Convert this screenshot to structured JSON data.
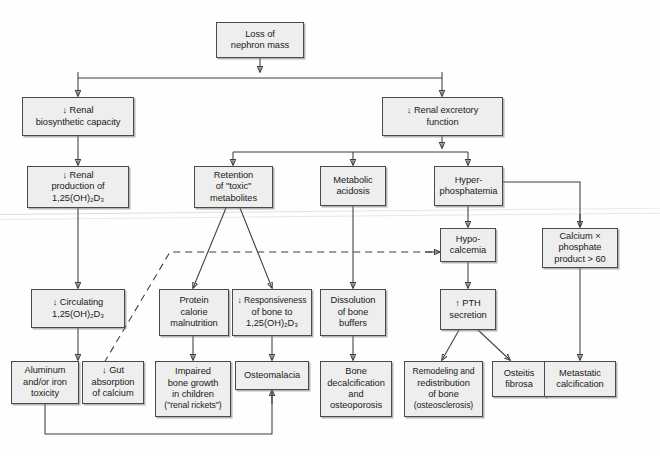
{
  "diagram": {
    "type": "flowchart",
    "box_fill": "#eeeeee",
    "box_stroke": "#4a4a4a",
    "nodes": [
      {
        "id": "loss",
        "label": "Loss of\nnephron mass",
        "line1": "Loss of",
        "line2": "nephron mass",
        "line3": "",
        "line4": ""
      },
      {
        "id": "biosynth",
        "label": "↓ Renal\nbiosynthetic capacity",
        "line1": "↓ Renal",
        "line2": "biosynthetic capacity",
        "line3": "",
        "line4": ""
      },
      {
        "id": "excretory",
        "label": "↓ Renal excretory\nfunction",
        "line1": "↓ Renal excretory",
        "line2": "function",
        "line3": "",
        "line4": ""
      },
      {
        "id": "production",
        "label": "↓ Renal\nproduction of\n1,25(OH)2D3",
        "line1": "↓ Renal",
        "line2": "production of",
        "line3": "1,25(OH)₂D₃",
        "line4": ""
      },
      {
        "id": "retention",
        "label": "Retention\nof \"toxic\"\nmetabolites",
        "line1": "Retention",
        "line2": "of \"toxic\"",
        "line3": "metabolites",
        "line4": ""
      },
      {
        "id": "acidosis",
        "label": "Metabolic\nacidosis",
        "line1": "Metabolic",
        "line2": "acidosis",
        "line3": "",
        "line4": ""
      },
      {
        "id": "hyperphos",
        "label": "Hyper-\nphosphatemia",
        "line1": "Hyper-",
        "line2": "phosphatemia",
        "line3": "",
        "line4": ""
      },
      {
        "id": "hypocalcemia",
        "label": "Hypo-\ncalcemia",
        "line1": "Hypo-",
        "line2": "calcemia",
        "line3": "",
        "line4": ""
      },
      {
        "id": "caxphos",
        "label": "Calcium ×\nphosphate\nproduct > 60",
        "line1": "Calcium ×",
        "line2": "phosphate",
        "line3": "product > 60",
        "line4": ""
      },
      {
        "id": "circulating",
        "label": "↓ Circulating\n1,25(OH)2D3",
        "line1": "↓ Circulating",
        "line2": "1,25(OH)₂D₃",
        "line3": "",
        "line4": ""
      },
      {
        "id": "pcm",
        "label": "Protein\ncalorie\nmalnutrition",
        "line1": "Protein",
        "line2": "calorie",
        "line3": "malnutrition",
        "line4": ""
      },
      {
        "id": "responsiveness",
        "label": "↓ Responsiveness\nof bone to\n1,25(OH)2D3",
        "line1": "↓ Responsiveness",
        "line2": "of bone to",
        "line3": "1,25(OH)₂D₃",
        "line4": ""
      },
      {
        "id": "dissolution",
        "label": "Dissolution\nof bone\nbuffers",
        "line1": "Dissolution",
        "line2": "of bone",
        "line3": "buffers",
        "line4": ""
      },
      {
        "id": "pth",
        "label": "↑ PTH\nsecretion",
        "line1": "↑ PTH",
        "line2": "secretion",
        "line3": "",
        "line4": ""
      },
      {
        "id": "aluminum",
        "label": "Aluminum\nand/or iron\ntoxicity",
        "line1": "Aluminum",
        "line2": "and/or iron",
        "line3": "toxicity",
        "line4": ""
      },
      {
        "id": "gut",
        "label": "↓ Gut\nabsorption\nof calcium",
        "line1": "↓ Gut",
        "line2": "absorption",
        "line3": "of calcium",
        "line4": ""
      },
      {
        "id": "impaired",
        "label": "Impaired\nbone growth\nin children\n(\"renal rickets\")",
        "line1": "Impaired",
        "line2": "bone growth",
        "line3": "in children",
        "line4": "(\"renal rickets\")"
      },
      {
        "id": "osteomalacia",
        "label": "Osteomalacia",
        "line1": "Osteomalacia",
        "line2": "",
        "line3": "",
        "line4": ""
      },
      {
        "id": "decalcification",
        "label": "Bone\ndecalcification\nand\nosteoporosis",
        "line1": "Bone",
        "line2": "decalcification",
        "line3": "and",
        "line4": "osteoporosis"
      },
      {
        "id": "remodeling",
        "label": "Remodeling and\nredistribution\nof bone\n(osteosclerosis)",
        "line1": "Remodeling and",
        "line2": "redistribution",
        "line3": "of bone",
        "line4": "(osteosclerosis)"
      },
      {
        "id": "osteitis",
        "label": "Osteitis\nfibrosa",
        "line1": "Osteitis",
        "line2": "fibrosa",
        "line3": "",
        "line4": ""
      },
      {
        "id": "metastatic",
        "label": "Metastatic\ncalcification",
        "line1": "Metastatic",
        "line2": "calcification",
        "line3": "",
        "line4": ""
      }
    ],
    "edges": [
      {
        "from": "loss",
        "to": "biosynth",
        "style": "solid"
      },
      {
        "from": "loss",
        "to": "excretory",
        "style": "solid"
      },
      {
        "from": "biosynth",
        "to": "production",
        "style": "solid"
      },
      {
        "from": "excretory",
        "to": "retention",
        "style": "solid"
      },
      {
        "from": "excretory",
        "to": "acidosis",
        "style": "solid"
      },
      {
        "from": "excretory",
        "to": "hyperphos",
        "style": "solid"
      },
      {
        "from": "hyperphos",
        "to": "hypocalcemia",
        "style": "solid"
      },
      {
        "from": "hyperphos",
        "to": "caxphos",
        "style": "solid"
      },
      {
        "from": "production",
        "to": "circulating",
        "style": "solid"
      },
      {
        "from": "retention",
        "to": "pcm",
        "style": "solid"
      },
      {
        "from": "retention",
        "to": "responsiveness",
        "style": "solid"
      },
      {
        "from": "acidosis",
        "to": "dissolution",
        "style": "solid"
      },
      {
        "from": "hypocalcemia",
        "to": "pth",
        "style": "solid"
      },
      {
        "from": "circulating",
        "to": "gut",
        "style": "solid"
      },
      {
        "from": "gut",
        "to": "hypocalcemia",
        "style": "dashed"
      },
      {
        "from": "pcm",
        "to": "impaired",
        "style": "solid"
      },
      {
        "from": "responsiveness",
        "to": "osteomalacia",
        "style": "solid"
      },
      {
        "from": "dissolution",
        "to": "decalcification",
        "style": "solid"
      },
      {
        "from": "pth",
        "to": "remodeling",
        "style": "solid"
      },
      {
        "from": "pth",
        "to": "osteitis",
        "style": "solid"
      },
      {
        "from": "caxphos",
        "to": "metastatic",
        "style": "solid"
      },
      {
        "from": "aluminum",
        "to": "osteomalacia",
        "style": "solid"
      }
    ]
  }
}
